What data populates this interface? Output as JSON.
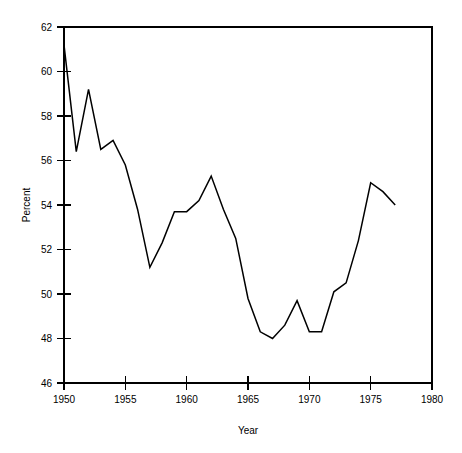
{
  "chart_data": {
    "type": "line",
    "title": "",
    "xlabel": "Year",
    "ylabel": "Percent",
    "xlim": [
      1950,
      1980
    ],
    "ylim": [
      46,
      62
    ],
    "xticks": [
      1950,
      1955,
      1960,
      1965,
      1970,
      1975,
      1980
    ],
    "xtick_labels": [
      "1950",
      "1955",
      "1960",
      "1965",
      "1970",
      "1975",
      "1980"
    ],
    "yticks": [
      46,
      48,
      50,
      52,
      54,
      56,
      58,
      60,
      62
    ],
    "ytick_labels": [
      "46",
      "48",
      "50",
      "52",
      "54",
      "56",
      "58",
      "60",
      "62"
    ],
    "grid": false,
    "legend": false,
    "line_color": "#000000",
    "x": [
      1950,
      1951,
      1952,
      1953,
      1954,
      1955,
      1956,
      1957,
      1958,
      1959,
      1960,
      1961,
      1962,
      1963,
      1964,
      1965,
      1966,
      1967,
      1968,
      1969,
      1970,
      1971,
      1972,
      1973,
      1974,
      1975,
      1976,
      1977
    ],
    "values": [
      61.2,
      56.4,
      59.2,
      56.5,
      56.9,
      55.8,
      53.8,
      51.2,
      52.3,
      53.7,
      53.7,
      54.2,
      55.3,
      53.8,
      52.5,
      49.8,
      48.3,
      48.0,
      48.6,
      49.7,
      48.3,
      48.3,
      50.1,
      50.5,
      52.4,
      55.0,
      54.6,
      54.0
    ],
    "series": [
      {
        "name": "Percent",
        "values": [
          61.2,
          56.4,
          59.2,
          56.5,
          56.9,
          55.8,
          53.8,
          51.2,
          52.3,
          53.7,
          53.7,
          54.2,
          55.3,
          53.8,
          52.5,
          49.8,
          48.3,
          48.0,
          48.6,
          49.7,
          48.3,
          48.3,
          50.1,
          50.5,
          52.4,
          55.0,
          54.6,
          54.0
        ]
      }
    ]
  },
  "axes": {
    "y_title": "Percent",
    "x_title": "Year"
  }
}
